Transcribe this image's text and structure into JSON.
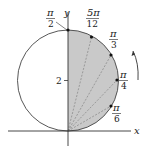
{
  "diagram": {
    "axes": {
      "x_label": "x",
      "y_label": "y",
      "y_tick_label": "2"
    },
    "shade_color": "#c9c9c9",
    "stroke_color": "#333333",
    "points": [
      {
        "id": "p-pi2",
        "num": "π",
        "den": "2"
      },
      {
        "id": "p-5pi12",
        "num": "5π",
        "den": "12"
      },
      {
        "id": "p-pi3",
        "num": "π",
        "den": "3"
      },
      {
        "id": "p-pi4",
        "num": "π",
        "den": "4"
      },
      {
        "id": "p-pi6",
        "num": "π",
        "den": "6"
      }
    ],
    "arrow": "counterclockwise direction of increasing theta"
  }
}
